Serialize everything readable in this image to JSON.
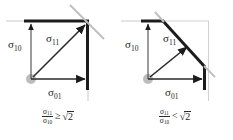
{
  "figure": {
    "background_color": "#ffffff",
    "stroke_color": "#1c1c1c",
    "light_stroke_color": "#b9b9b9",
    "node_color": "#b0b0b0"
  },
  "panels": [
    {
      "id": "left",
      "name": "stress-diagram-high-ratio",
      "labels": {
        "sigma10": "σ",
        "sigma10_sub": "10",
        "sigma11": "σ",
        "sigma11_sub": "11",
        "sigma01": "σ",
        "sigma01_sub": "01"
      },
      "caption": {
        "numerator": "σ",
        "numerator_sub": "11",
        "denominator": "σ",
        "denominator_sub": "10",
        "relation": "≥",
        "radical_sign": "√",
        "radicand": "2"
      }
    },
    {
      "id": "right",
      "name": "stress-diagram-low-ratio",
      "labels": {
        "sigma10": "σ",
        "sigma10_sub": "10",
        "sigma11": "σ",
        "sigma11_sub": "11",
        "sigma01": "σ",
        "sigma01_sub": "01"
      },
      "caption": {
        "numerator": "σ",
        "numerator_sub": "11",
        "denominator": "σ",
        "denominator_sub": "10",
        "relation": "<",
        "radical_sign": "√",
        "radicand": "2"
      }
    }
  ]
}
